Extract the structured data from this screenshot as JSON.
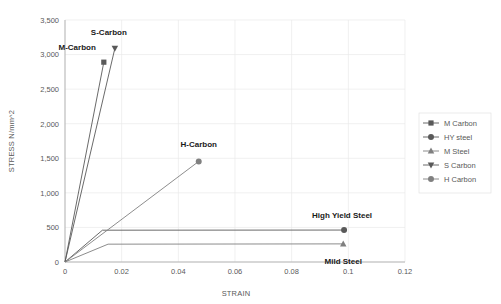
{
  "chart_data": {
    "type": "line",
    "title": "",
    "xlabel": "STRAIN",
    "ylabel": "STRESS N/mm^2",
    "xlim": [
      0,
      0.12
    ],
    "ylim": [
      0,
      3500
    ],
    "xticks": [
      "0",
      "0.02",
      "0.04",
      "0.06",
      "0.08",
      "0.1",
      "0.12"
    ],
    "xtick_values": [
      0,
      0.02,
      0.04,
      0.06,
      0.08,
      0.1,
      0.12
    ],
    "yticks": [
      "0",
      "500",
      "1,000",
      "1,500",
      "2,000",
      "2,500",
      "3,000",
      "3,500"
    ],
    "ytick_values": [
      0,
      500,
      1000,
      1500,
      2000,
      2500,
      3000,
      3500
    ],
    "grid": true,
    "legend_position": "right",
    "series": [
      {
        "name": "M Carbon",
        "marker": "square",
        "color": "#595959",
        "points": [
          [
            0,
            0
          ],
          [
            0.0137,
            2890
          ]
        ],
        "end_marker_point": [
          0.0137,
          2890
        ]
      },
      {
        "name": "HY steel",
        "marker": "circle",
        "color": "#595959",
        "points": [
          [
            0,
            0
          ],
          [
            0.0132,
            460
          ],
          [
            0.0985,
            462
          ]
        ],
        "end_marker_point": [
          0.0985,
          462
        ]
      },
      {
        "name": "M Steel",
        "marker": "triangle-up",
        "color": "#7f7f7f",
        "points": [
          [
            0,
            0
          ],
          [
            0.0152,
            258
          ],
          [
            0.0982,
            262
          ]
        ],
        "end_marker_point": [
          0.0982,
          262
        ]
      },
      {
        "name": "S Carbon",
        "marker": "triangle-down",
        "color": "#595959",
        "points": [
          [
            0,
            0
          ],
          [
            0.0176,
            3090
          ]
        ],
        "end_marker_point": [
          0.0176,
          3090
        ]
      },
      {
        "name": "H Carbon",
        "marker": "circle",
        "color": "#808080",
        "points": [
          [
            0,
            0
          ],
          [
            0.0472,
            1455
          ]
        ],
        "end_marker_point": [
          0.0472,
          1455
        ]
      }
    ],
    "annotations": [
      {
        "text": "M-Carbon",
        "x": 0.0137,
        "y": 2890,
        "anchor": "end",
        "dx": -8,
        "dy": -12
      },
      {
        "text": "S-Carbon",
        "x": 0.0176,
        "y": 3090,
        "anchor": "middle",
        "dx": -6,
        "dy": -13
      },
      {
        "text": "H-Carbon",
        "x": 0.0472,
        "y": 1455,
        "anchor": "middle",
        "dx": 0,
        "dy": -14
      },
      {
        "text": "High Yield Steel",
        "x": 0.0985,
        "y": 462,
        "anchor": "middle",
        "dx": -2,
        "dy": -12
      },
      {
        "text": "Mild Steel",
        "x": 0.0982,
        "y": 262,
        "anchor": "middle",
        "dx": 0,
        "dy": 20
      }
    ]
  },
  "legend": {
    "items": [
      {
        "label": "M Carbon",
        "marker": "square",
        "color": "#595959"
      },
      {
        "label": "HY steel",
        "marker": "circle",
        "color": "#595959"
      },
      {
        "label": "M Steel",
        "marker": "triangle-up",
        "color": "#7f7f7f"
      },
      {
        "label": "S Carbon",
        "marker": "triangle-down",
        "color": "#595959"
      },
      {
        "label": "H Carbon",
        "marker": "circle",
        "color": "#808080"
      }
    ]
  }
}
